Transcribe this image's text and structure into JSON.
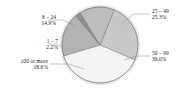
{
  "chart_data": {
    "type": "pie",
    "title": "",
    "subtitle": "",
    "xlabel": "",
    "ylabel": "",
    "legend_position": "none",
    "grid": false,
    "labels_outside": true,
    "categories": [
      "25 – 49",
      "50 – 99",
      "100 or more",
      "1 – 7",
      "8 – 24"
    ],
    "values": [
      25.3,
      39.0,
      18.6,
      2.2,
      14.9
    ],
    "value_suffix": "%",
    "slices": [
      {
        "label": "25 – 49",
        "percent_text": "25.3%",
        "value": 25.3,
        "color": "#c9c9c9",
        "label_side": "right",
        "label_x": 152,
        "label_y": 8,
        "leader_x1": 121,
        "leader_y1": 24,
        "leader_x2": 150,
        "leader_y2": 14
      },
      {
        "label": "50 – 99",
        "percent_text": "39.0%",
        "value": 39.0,
        "color": "#f4f4f4",
        "label_side": "right",
        "label_x": 152,
        "label_y": 50,
        "leader_x1": 124,
        "leader_y1": 60,
        "leader_x2": 150,
        "leader_y2": 56
      },
      {
        "label": "100 or more",
        "percent_text": "18.6%",
        "value": 18.6,
        "color": "#b3b3b3",
        "label_side": "left",
        "label_x": 4,
        "label_y": 58,
        "leader_x1": 84,
        "leader_y1": 69,
        "leader_x2": 50,
        "leader_y2": 64
      },
      {
        "label": "1 – 7",
        "percent_text": "2.2%",
        "value": 2.2,
        "color": "#8f8f8f",
        "label_side": "left",
        "label_x": 14,
        "label_y": 38,
        "leader_x1": 63,
        "leader_y1": 48,
        "leader_x2": 48,
        "leader_y2": 44
      },
      {
        "label": "8 – 24",
        "percent_text": "14.9%",
        "value": 14.9,
        "color": "#bdbdbd",
        "label_side": "left",
        "label_x": 12,
        "label_y": 14,
        "leader_x1": 75,
        "leader_y1": 26,
        "leader_x2": 48,
        "leader_y2": 20
      }
    ],
    "style": {
      "background": "#ffffff",
      "rim_tick_color": "#9a9a9a",
      "wedge_border": "#6b6b6b",
      "leader_line_color": "#8c8c8c",
      "text_color": "#1a1a1a",
      "center_x": 100,
      "center_y": 45,
      "radius": 38,
      "start_angle_deg": -68
    }
  }
}
